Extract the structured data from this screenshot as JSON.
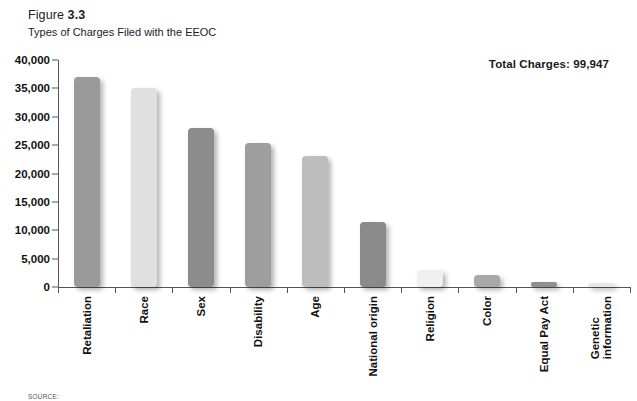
{
  "figure": {
    "label": "Figure",
    "number": "3.3",
    "subtitle": "Types of Charges Filed with the EEOC"
  },
  "annotation": {
    "total_charges": "Total Charges: 99,947"
  },
  "source": {
    "text": "SOURCE:"
  },
  "colors": {
    "axis": "#555555",
    "text": "#1a1a1a",
    "background": "#ffffff"
  },
  "chart_data": {
    "type": "bar",
    "title": "Types of Charges Filed with the EEOC",
    "xlabel": "",
    "ylabel": "",
    "ylim": [
      0,
      40000
    ],
    "grid": false,
    "legend": "none",
    "yticks": [
      0,
      5000,
      10000,
      15000,
      20000,
      25000,
      30000,
      35000,
      40000
    ],
    "ytick_labels": [
      "0",
      "5,000",
      "10,000",
      "15,000",
      "20,000",
      "25,000",
      "30,000",
      "35,000",
      "40,000"
    ],
    "categories": [
      "Retaliation",
      "Race",
      "Sex",
      "Disability",
      "Age",
      "National origin",
      "Religion",
      "Color",
      "Equal Pay Act",
      "Genetic information"
    ],
    "category_lines": [
      [
        "Retaliation"
      ],
      [
        "Race"
      ],
      [
        "Sex"
      ],
      [
        "Disability"
      ],
      [
        "Age"
      ],
      [
        "National origin"
      ],
      [
        "Religion"
      ],
      [
        "Color"
      ],
      [
        "Equal Pay Act"
      ],
      [
        "Genetic",
        "information"
      ]
    ],
    "values": [
      37000,
      35000,
      28000,
      25400,
      23000,
      11500,
      3000,
      2100,
      950,
      400
    ],
    "bar_colors": [
      "#9a9a9a",
      "#e0e0e0",
      "#8c8c8c",
      "#9e9e9e",
      "#bdbdbd",
      "#8a8a8a",
      "#f0f0f0",
      "#a8a8a8",
      "#8f8f8f",
      "#e8e8e8"
    ],
    "annotations": [
      "Total Charges: 99,947"
    ]
  }
}
